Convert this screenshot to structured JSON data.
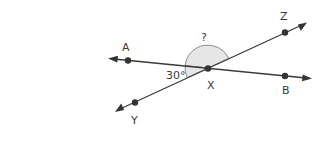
{
  "diagram": {
    "type": "intersecting-lines-angle",
    "points": {
      "A": {
        "label": "A"
      },
      "B": {
        "label": "B"
      },
      "X": {
        "label": "X"
      },
      "Y": {
        "label": "Y"
      },
      "Z": {
        "label": "Z"
      }
    },
    "lines": [
      {
        "name": "line-AB",
        "through": [
          "A",
          "X",
          "B"
        ]
      },
      {
        "name": "line-YZ",
        "through": [
          "Y",
          "X",
          "Z"
        ]
      }
    ],
    "angles": {
      "known": {
        "label": "30°",
        "between": [
          "A",
          "X",
          "Y"
        ]
      },
      "unknown": {
        "label": "?",
        "between": [
          "A",
          "X",
          "Z"
        ]
      }
    },
    "colors": {
      "line": "#3a3a3a",
      "shade": "#e6e6e6",
      "shade_stroke": "#8a8a8a"
    }
  }
}
